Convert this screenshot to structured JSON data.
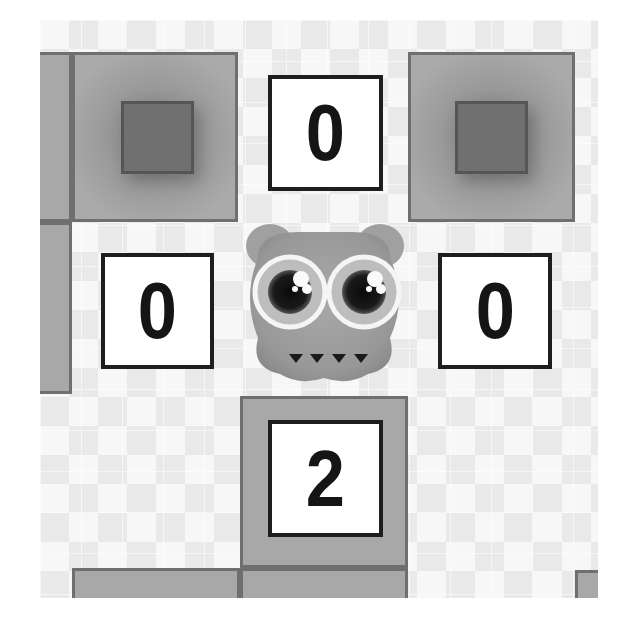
{
  "game": {
    "tiles": {
      "top": "0",
      "left": "0",
      "right": "0",
      "bottom": "2"
    },
    "colors": {
      "block_fill": "#a8a8a8",
      "block_border": "#6f6f6f",
      "inner_square": "#707070",
      "number_box_bg": "#ffffff",
      "number_box_border": "#1e1e1e",
      "creature_body": "#9c9c9c"
    },
    "player": {
      "name": "owl-creature",
      "state": "idle"
    }
  }
}
